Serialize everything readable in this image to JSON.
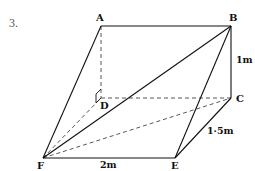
{
  "question_number": "3.",
  "vertices": {
    "A": {
      "label": "A",
      "x": 101,
      "y": 26
    },
    "B": {
      "label": "B",
      "x": 231,
      "y": 26
    },
    "C": {
      "label": "C",
      "x": 231,
      "y": 98
    },
    "D": {
      "label": "D",
      "x": 101,
      "y": 98
    },
    "E": {
      "label": "E",
      "x": 175,
      "y": 158
    },
    "F": {
      "label": "F",
      "x": 43,
      "y": 158
    }
  },
  "dimensions": {
    "BC": "1m",
    "CE": "1·5m",
    "FE": "2m"
  },
  "edges": {
    "solid": [
      "A-B",
      "B-C",
      "A-F",
      "F-E",
      "E-C",
      "F-B",
      "E-B"
    ],
    "dashed": [
      "A-D",
      "D-C",
      "F-D",
      "F-C"
    ]
  },
  "right_angle_marker_at": "D",
  "colors": {
    "line": "#111111",
    "dashed": "#444444",
    "question_number": "#555555",
    "background": "#ffffff"
  }
}
